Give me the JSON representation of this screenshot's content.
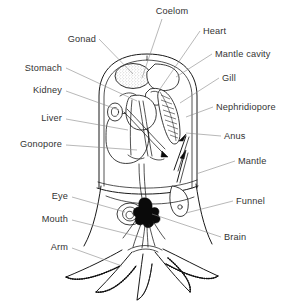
{
  "diagram": {
    "background_color": "#ffffff",
    "line_color": "#1a1a1a",
    "leader_color": "#888888",
    "label_color": "#333333",
    "width": 295,
    "height": 306
  },
  "labels": {
    "coelom": "Coelom",
    "heart": "Heart",
    "mantle_cavity": "Mantle cavity",
    "gonad": "Gonad",
    "gill": "Gill",
    "stomach": "Stomach",
    "kidney": "Kidney",
    "nephridiopore": "Nephridiopore",
    "liver": "Liver",
    "anus": "Anus",
    "gonopore": "Gonopore",
    "mantle": "Mantle",
    "eye": "Eye",
    "funnel": "Funnel",
    "mouth": "Mouth",
    "brain": "Brain",
    "arm": "Arm"
  },
  "parts": [
    {
      "key": "coelom",
      "label": "Coelom",
      "side": "top",
      "text_x": 172,
      "text_y": 14,
      "anchor": "mid",
      "leader": "M 162 19 L 142 78"
    },
    {
      "key": "heart",
      "label": "Heart",
      "side": "right",
      "text_x": 203,
      "text_y": 34,
      "anchor": "start",
      "leader": "M 200 31 L 160 89"
    },
    {
      "key": "mantle_cavity",
      "label": "Mantle cavity",
      "side": "right",
      "text_x": 215,
      "text_y": 57,
      "anchor": "start",
      "leader": "M 212 54 L 176 77"
    },
    {
      "key": "gonad",
      "label": "Gonad",
      "side": "left",
      "text_x": 96,
      "text_y": 42,
      "anchor": "end",
      "leader": "M 99 39 L 133 74"
    },
    {
      "key": "gill",
      "label": "Gill",
      "side": "right",
      "text_x": 222,
      "text_y": 81,
      "anchor": "start",
      "leader": "M 219 78 L 180 103"
    },
    {
      "key": "stomach",
      "label": "Stomach",
      "side": "left",
      "text_x": 62,
      "text_y": 71,
      "anchor": "end",
      "leader": "M 66 68 L 137 101"
    },
    {
      "key": "kidney",
      "label": "Kidney",
      "side": "left",
      "text_x": 62,
      "text_y": 93,
      "anchor": "end",
      "leader": "M 66 91 L 119 110"
    },
    {
      "key": "nephridiopore",
      "label": "Nephridiopore",
      "side": "right",
      "text_x": 216,
      "text_y": 110,
      "anchor": "start",
      "leader": "M 213 107 L 186 117"
    },
    {
      "key": "liver",
      "label": "Liver",
      "side": "left",
      "text_x": 62,
      "text_y": 121,
      "anchor": "end",
      "leader": "M 66 119 L 128 130"
    },
    {
      "key": "anus",
      "label": "Anus",
      "side": "right",
      "text_x": 224,
      "text_y": 139,
      "anchor": "start",
      "leader": "M 221 136 L 186 133"
    },
    {
      "key": "gonopore",
      "label": "Gonopore",
      "side": "left",
      "text_x": 62,
      "text_y": 147,
      "anchor": "end",
      "leader": "M 66 145 L 137 150"
    },
    {
      "key": "mantle",
      "label": "Mantle",
      "side": "right",
      "text_x": 238,
      "text_y": 164,
      "anchor": "start",
      "leader": "M 235 161 L 196 174"
    },
    {
      "key": "eye",
      "label": "Eye",
      "side": "left",
      "text_x": 68,
      "text_y": 199,
      "anchor": "end",
      "leader": "M 72 197 L 125 212"
    },
    {
      "key": "funnel",
      "label": "Funnel",
      "side": "right",
      "text_x": 236,
      "text_y": 204,
      "anchor": "start",
      "leader": "M 233 201 L 186 213"
    },
    {
      "key": "mouth",
      "label": "Mouth",
      "side": "left",
      "text_x": 68,
      "text_y": 222,
      "anchor": "end",
      "leader": "M 72 220 L 144 238"
    },
    {
      "key": "brain",
      "label": "Brain",
      "side": "right",
      "text_x": 224,
      "text_y": 240,
      "anchor": "start",
      "leader": "M 221 237 L 152 214"
    },
    {
      "key": "arm",
      "label": "Arm",
      "side": "left",
      "text_x": 68,
      "text_y": 250,
      "anchor": "end",
      "leader": "M 72 248 L 122 266"
    }
  ]
}
